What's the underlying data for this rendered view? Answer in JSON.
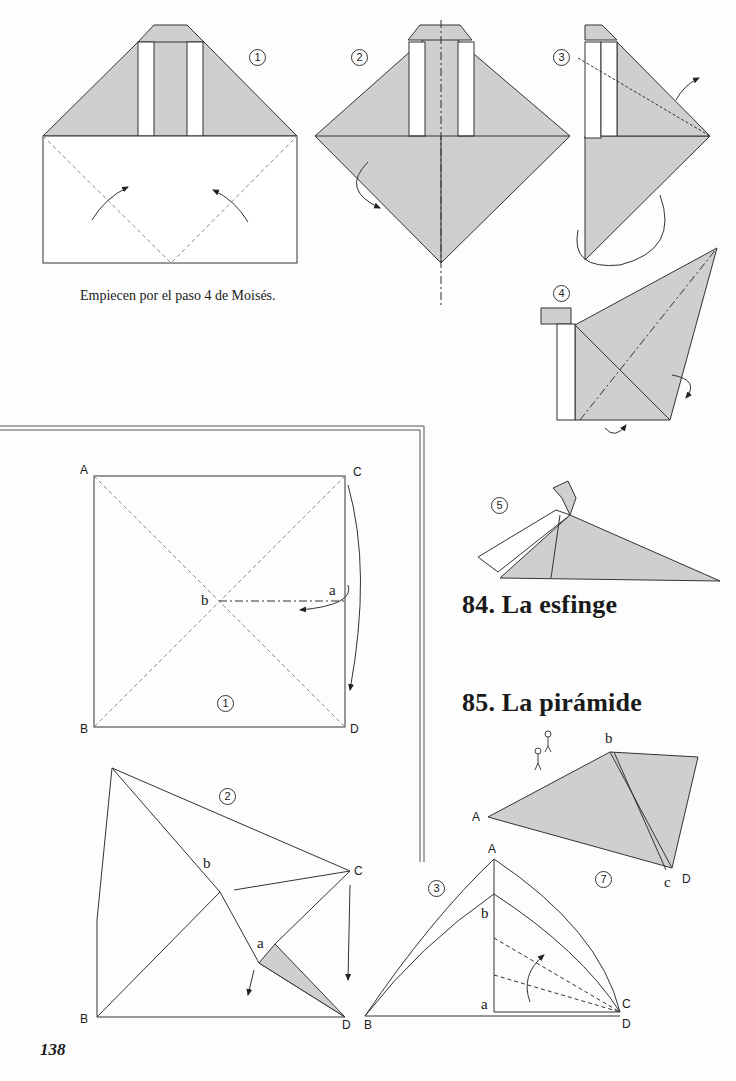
{
  "page": {
    "number": "138",
    "caption": "Empiecen por el paso 4 de Moisés.",
    "headings": {
      "sphinx": "84.  La esfinge",
      "pyramid": "85.  La pirámide"
    },
    "colors": {
      "fill": "#cfcfcf",
      "line": "#333333",
      "paper": "#fdfdfd"
    }
  },
  "sphinx_steps": [
    "1",
    "2",
    "3",
    "4",
    "5"
  ],
  "pyramid_steps": [
    "1",
    "2",
    "3",
    "7"
  ],
  "pyramid_labels": {
    "step1": {
      "A": "A",
      "B": "B",
      "C": "C",
      "D": "D",
      "a": "a",
      "b": "b"
    },
    "step2": {
      "B": "B",
      "C": "C",
      "D": "D",
      "a": "a",
      "b": "b"
    },
    "step3": {
      "A": "A",
      "B": "B",
      "C": "C",
      "D": "D",
      "a": "a",
      "b": "b"
    },
    "step7": {
      "A": "A",
      "b": "b",
      "c": "c",
      "D": "D"
    }
  }
}
